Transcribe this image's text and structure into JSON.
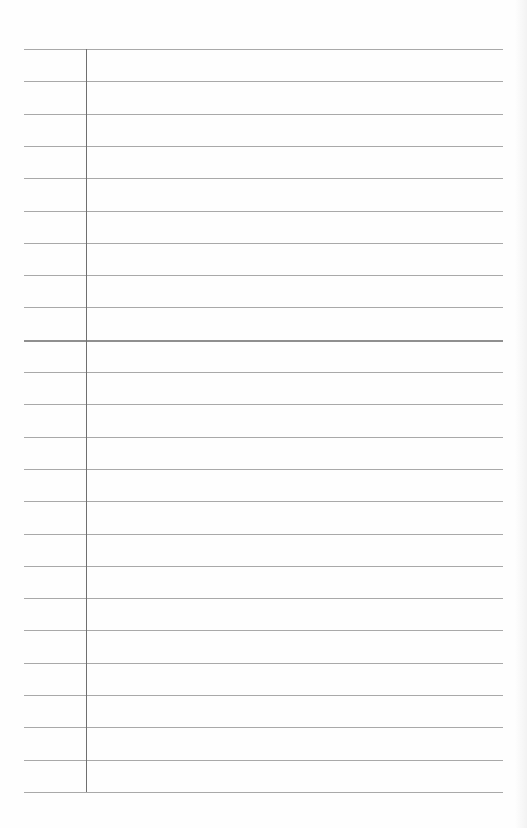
{
  "page": {
    "type": "lined-notebook-paper",
    "rule_count": 24,
    "first_rule_y": 49,
    "rule_spacing": 32.3,
    "rule_left": 24,
    "rule_right": 503,
    "margin_x": 86,
    "thick_rule_index": 9,
    "colors": {
      "paper": "#fefefe",
      "rule": "#a9a9a9",
      "margin": "#6f6f6f"
    }
  }
}
